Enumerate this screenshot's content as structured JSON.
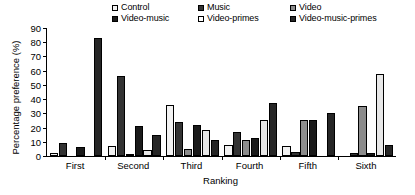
{
  "chart_data": {
    "type": "bar",
    "title": "",
    "xlabel": "Ranking",
    "ylabel": "Percentage preference (%)",
    "ylim": [
      0,
      90
    ],
    "yticks": [
      0,
      10,
      20,
      30,
      40,
      50,
      60,
      70,
      80,
      90
    ],
    "grid": false,
    "legend_position": "top",
    "categories": [
      "First",
      "Second",
      "Third",
      "Fourth",
      "Fifth",
      "Sixth"
    ],
    "series": [
      {
        "name": "Control",
        "color": "#f2f2f2",
        "values": [
          2,
          7,
          36,
          8,
          7,
          0
        ]
      },
      {
        "name": "Music",
        "color": "#333333",
        "values": [
          9,
          56,
          24,
          17,
          3,
          2
        ]
      },
      {
        "name": "Video",
        "color": "#8c8c8c",
        "values": [
          0,
          1,
          5,
          11,
          25,
          35
        ]
      },
      {
        "name": "Video-music",
        "color": "#1a1a1a",
        "values": [
          6,
          21,
          22,
          13,
          25,
          2
        ]
      },
      {
        "name": "Video-primes",
        "color": "#e8e8e8",
        "values": [
          0,
          4,
          18,
          25,
          0,
          58
        ]
      },
      {
        "name": "Video-music-primes",
        "color": "#262626",
        "values": [
          83,
          15,
          11,
          37,
          30,
          8
        ]
      }
    ]
  },
  "legend": {
    "items": [
      {
        "label": "Control",
        "color": "#f2f2f2"
      },
      {
        "label": "Music",
        "color": "#333333"
      },
      {
        "label": "Video",
        "color": "#8c8c8c"
      },
      {
        "label": "Video-music",
        "color": "#1a1a1a"
      },
      {
        "label": "Video-primes",
        "color": "#ffffff"
      },
      {
        "label": "Video-music-primes",
        "color": "#262626"
      }
    ]
  },
  "axes": {
    "y_title": "Percentage preference (%)",
    "x_title": "Ranking",
    "y_tick_labels": [
      "0",
      "10",
      "20",
      "30",
      "40",
      "50",
      "60",
      "70",
      "80",
      "90"
    ],
    "x_tick_labels": [
      "First",
      "Second",
      "Third",
      "Fourth",
      "Fifth",
      "Sixth"
    ]
  }
}
